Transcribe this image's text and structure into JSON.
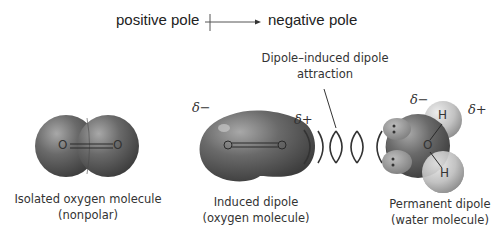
{
  "legend": {
    "positive_label": "positive pole",
    "negative_label": "negative pole",
    "arrow_icon": "dipole-arrow"
  },
  "annotation": {
    "line1": "Dipole–induced dipole",
    "line2": "attraction"
  },
  "molecules": [
    {
      "name": "isolated-oxygen",
      "caption_line1": "Isolated oxygen molecule",
      "caption_line2": "(nonpolar)",
      "atoms": [
        "O",
        "O"
      ]
    },
    {
      "name": "induced-dipole",
      "caption_line1": "Induced dipole",
      "caption_line2": "(oxygen molecule)",
      "atoms": [
        "O",
        "O"
      ],
      "partial_negative": "δ−",
      "partial_positive": "δ+"
    },
    {
      "name": "permanent-dipole",
      "caption_line1": "Permanent dipole",
      "caption_line2": "(water molecule)",
      "atoms": [
        "O",
        "H",
        "H"
      ],
      "partial_negative": "δ−",
      "partial_positive": "δ+"
    }
  ],
  "colors": {
    "molecule_dark": "#5a5a5a",
    "molecule_light": "#9a9a9a",
    "hydrogen": "#c8c8c8",
    "lines": "#333333"
  }
}
